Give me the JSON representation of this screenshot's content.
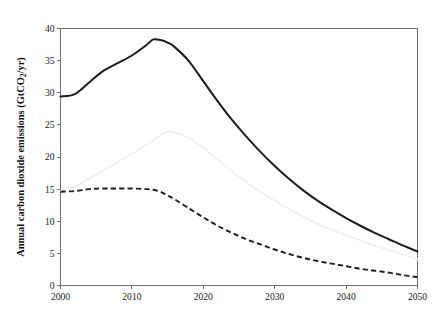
{
  "chart_data": {
    "type": "line",
    "title": "",
    "subtitle": "",
    "xlabel": "",
    "ylabel": "Annual carbon dioxide emissions (GtCO2/yr)",
    "ylabel_parts": {
      "prefix": "Annual carbon dioxide emissions (GtCO",
      "subscript": "2",
      "suffix": "/yr)"
    },
    "xlim": [
      2000,
      2050
    ],
    "ylim": [
      0,
      40
    ],
    "xticks": [
      2000,
      2010,
      2020,
      2030,
      2040,
      2050
    ],
    "yticks": [
      0,
      5,
      10,
      15,
      20,
      25,
      30,
      35,
      40
    ],
    "xtick_labels": [
      "2000",
      "2010",
      "2020",
      "2030",
      "2040",
      "2050"
    ],
    "ytick_labels": [
      "0",
      "5",
      "10",
      "15",
      "20",
      "25",
      "30",
      "35",
      "40"
    ],
    "grid": false,
    "legend": "none",
    "x": [
      2000,
      2002,
      2004,
      2006,
      2008,
      2010,
      2012,
      2013,
      2014,
      2015,
      2016,
      2018,
      2020,
      2022,
      2024,
      2026,
      2028,
      2030,
      2032,
      2034,
      2036,
      2038,
      2040,
      2042,
      2044,
      2046,
      2048,
      2050
    ],
    "series": [
      {
        "name": "upper-solid-black",
        "style": "solid",
        "color": "#1c1c1c",
        "values": [
          29.4,
          29.8,
          31.6,
          33.4,
          34.6,
          35.8,
          37.4,
          38.3,
          38.2,
          37.8,
          37.1,
          34.9,
          31.8,
          28.7,
          25.8,
          23.2,
          20.8,
          18.6,
          16.6,
          14.8,
          13.2,
          11.8,
          10.5,
          9.3,
          8.2,
          7.2,
          6.2,
          5.3
        ]
      },
      {
        "name": "middle-light-gray",
        "style": "solid",
        "color": "#f0f0f0",
        "values": [
          14.7,
          15.4,
          16.6,
          17.9,
          19.2,
          20.5,
          21.9,
          22.6,
          23.4,
          23.9,
          23.8,
          23.0,
          21.4,
          19.6,
          17.8,
          16.1,
          14.6,
          13.2,
          11.9,
          10.7,
          9.6,
          8.7,
          7.8,
          7.0,
          6.2,
          5.5,
          4.8,
          4.1
        ]
      },
      {
        "name": "lower-dashed-black",
        "style": "dashed",
        "color": "#1c1c1c",
        "values": [
          14.6,
          14.7,
          15.0,
          15.1,
          15.1,
          15.1,
          15.0,
          14.9,
          14.6,
          14.0,
          13.4,
          12.0,
          10.6,
          9.3,
          8.2,
          7.2,
          6.4,
          5.6,
          4.9,
          4.3,
          3.8,
          3.4,
          3.0,
          2.6,
          2.3,
          2.0,
          1.6,
          1.3
        ]
      }
    ]
  }
}
